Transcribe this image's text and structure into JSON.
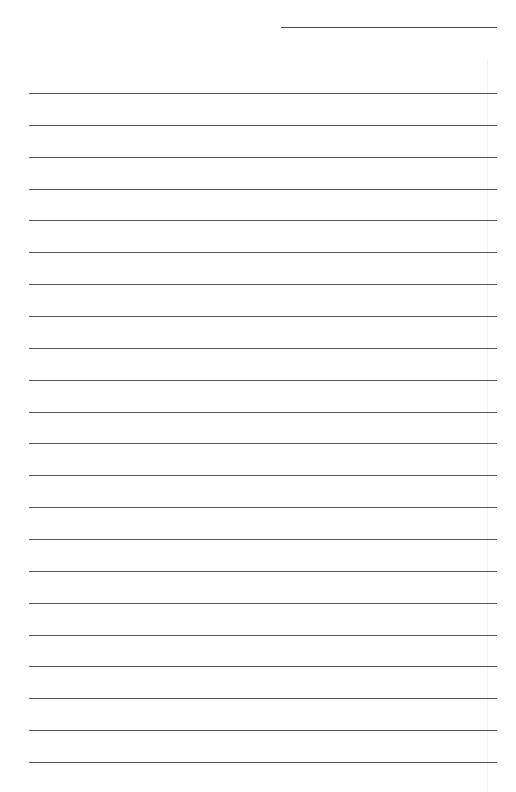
{
  "page": {
    "type": "lined-paper",
    "background_color": "#ffffff",
    "line_color": "#555555"
  },
  "header_line": {
    "x": 281,
    "y": 27,
    "width": 216
  },
  "ruled_lines": {
    "count": 22,
    "start_y": 93,
    "spacing": 31.86,
    "x": 29,
    "width": 468
  },
  "margin_shadow": {
    "x": 487,
    "y": 60,
    "height": 732
  }
}
